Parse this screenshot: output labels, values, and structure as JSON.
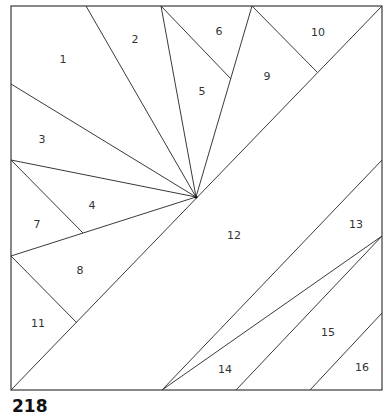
{
  "pattern": {
    "number": "218",
    "stroke_color": "#3a3a3a",
    "border": {
      "x1": 11,
      "y1": 6,
      "x2": 382,
      "y2": 390
    }
  },
  "vertices": {
    "TL": [
      11,
      6
    ],
    "TR": [
      382,
      6
    ],
    "BR": [
      382,
      390
    ],
    "BL": [
      11,
      390
    ],
    "hub": [
      196,
      197
    ],
    "T1": [
      86,
      6
    ],
    "T2": [
      161,
      6
    ],
    "T3": [
      252,
      6
    ],
    "L1": [
      11,
      84
    ],
    "L2": [
      11,
      160
    ],
    "L3": [
      11,
      256
    ],
    "R1": [
      382,
      160
    ],
    "R2": [
      382,
      236
    ],
    "R3": [
      382,
      313
    ],
    "B1": [
      162,
      390
    ],
    "B2": [
      236,
      390
    ],
    "B3": [
      310,
      390
    ],
    "J56": [
      231,
      79
    ],
    "J910": [
      317,
      72
    ],
    "J74": [
      83,
      233
    ],
    "J811": [
      77,
      323
    ]
  },
  "lines": [
    [
      "T1",
      "hub"
    ],
    [
      "T2",
      "hub"
    ],
    [
      "T3",
      "hub"
    ],
    [
      "L1",
      "hub"
    ],
    [
      "L2",
      "hub"
    ],
    [
      "L3",
      "hub"
    ],
    [
      "T2",
      "J56"
    ],
    [
      "T3",
      "J910"
    ],
    [
      "L2",
      "J74"
    ],
    [
      "L3",
      "J811"
    ],
    [
      "BL",
      "TR"
    ],
    [
      "B1",
      "R1"
    ],
    [
      "B1",
      "R2"
    ],
    [
      "B2",
      "R2"
    ],
    [
      "B3",
      "R3"
    ]
  ],
  "pieces": [
    {
      "id": "1",
      "x": 63,
      "y": 60
    },
    {
      "id": "2",
      "x": 135,
      "y": 40
    },
    {
      "id": "3",
      "x": 42,
      "y": 140
    },
    {
      "id": "4",
      "x": 92,
      "y": 206
    },
    {
      "id": "5",
      "x": 202,
      "y": 92
    },
    {
      "id": "6",
      "x": 219,
      "y": 32
    },
    {
      "id": "7",
      "x": 37,
      "y": 225
    },
    {
      "id": "8",
      "x": 80,
      "y": 271
    },
    {
      "id": "9",
      "x": 267,
      "y": 77
    },
    {
      "id": "10",
      "x": 318,
      "y": 33
    },
    {
      "id": "11",
      "x": 38,
      "y": 324
    },
    {
      "id": "12",
      "x": 234,
      "y": 236
    },
    {
      "id": "13",
      "x": 356,
      "y": 225
    },
    {
      "id": "14",
      "x": 225,
      "y": 370
    },
    {
      "id": "15",
      "x": 328,
      "y": 333
    },
    {
      "id": "16",
      "x": 362,
      "y": 368
    }
  ]
}
